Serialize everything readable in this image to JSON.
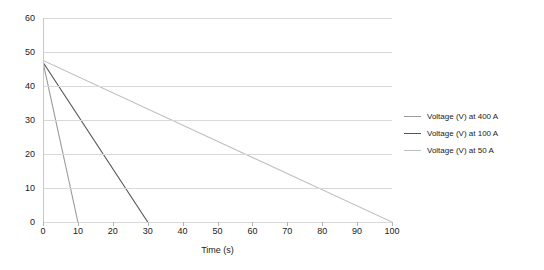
{
  "chart_data": {
    "type": "line",
    "title": "",
    "xlabel": "Time (s)",
    "ylabel": "",
    "xlim": [
      0,
      100
    ],
    "ylim": [
      0,
      60
    ],
    "xticks": [
      0,
      10,
      20,
      30,
      40,
      50,
      60,
      70,
      80,
      90,
      100
    ],
    "yticks": [
      0,
      10,
      20,
      30,
      40,
      50,
      60
    ],
    "grid": "horizontal",
    "legend_position": "right",
    "series": [
      {
        "name": "Voltage (V) at 400 A",
        "color": "#9a9a9a",
        "x": [
          0,
          10
        ],
        "y": [
          47,
          0
        ]
      },
      {
        "name": "Voltage (V) at 100 A",
        "color": "#555555",
        "x": [
          0,
          30
        ],
        "y": [
          47,
          0
        ]
      },
      {
        "name": "Voltage (V) at 50 A",
        "color": "#bfbfbf",
        "x": [
          0,
          100
        ],
        "y": [
          47.5,
          0
        ]
      }
    ]
  },
  "axes": {
    "x_tick_labels": [
      "0",
      "10",
      "20",
      "30",
      "40",
      "50",
      "60",
      "70",
      "80",
      "90",
      "100"
    ],
    "y_tick_labels": [
      "0",
      "10",
      "20",
      "30",
      "40",
      "50",
      "60"
    ],
    "x_axis_title": "Time (s)"
  },
  "legend": {
    "items": [
      {
        "label": "Voltage (V) at 400 A",
        "color": "#9a9a9a"
      },
      {
        "label": "Voltage (V) at 100 A",
        "color": "#555555"
      },
      {
        "label": "Voltage (V) at 50 A",
        "color": "#bfbfbf"
      }
    ]
  },
  "colors": {
    "gridline": "#d9d9d9",
    "axis": "#c8c8c8",
    "text": "#1a1a1a",
    "background": "#ffffff"
  }
}
